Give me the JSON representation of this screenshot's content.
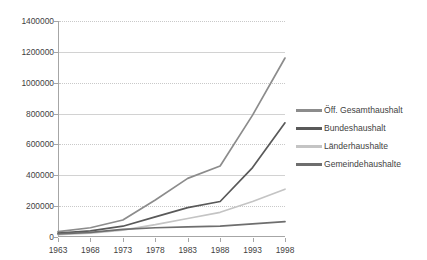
{
  "chart_data": {
    "type": "line",
    "title": "",
    "subtitle": "",
    "xlabel": "",
    "ylabel": "",
    "categories": [
      "1963",
      "1968",
      "1973",
      "1978",
      "1983",
      "1988",
      "1993",
      "1998"
    ],
    "x": [
      1963,
      1968,
      1973,
      1978,
      1983,
      1988,
      1993,
      1998
    ],
    "ylim": [
      0,
      1400000
    ],
    "xlim": [
      1963,
      1998
    ],
    "y_ticks": [
      0,
      200000,
      400000,
      600000,
      800000,
      1000000,
      1200000,
      1400000
    ],
    "y_tick_labels": [
      "0",
      "200000",
      "400000",
      "600000",
      "800000",
      "1000000",
      "1200000",
      "1400000"
    ],
    "grid": true,
    "grid_axis": "y",
    "legend_position": "right",
    "series": [
      {
        "name": "Öff. Gesamthaushalt",
        "color": "#8c8c8c",
        "values": [
          35000,
          60000,
          110000,
          240000,
          380000,
          460000,
          790000,
          1160000
        ]
      },
      {
        "name": "Bundeshaushalt",
        "color": "#595959",
        "values": [
          25000,
          40000,
          70000,
          130000,
          190000,
          230000,
          450000,
          740000
        ]
      },
      {
        "name": "Länderhaushalte",
        "color": "#c4c4c4",
        "values": [
          15000,
          25000,
          45000,
          80000,
          120000,
          160000,
          230000,
          310000
        ]
      },
      {
        "name": "Gemeindehaushalte",
        "color": "#6e6e6e",
        "values": [
          20000,
          30000,
          50000,
          60000,
          65000,
          70000,
          85000,
          100000
        ]
      }
    ]
  },
  "legend": {
    "items": [
      {
        "label": "Öff. Gesamthaushalt",
        "swatch": "legend-line-swatch"
      },
      {
        "label": "Bundeshaushalt",
        "swatch": "legend-line-swatch"
      },
      {
        "label": "Länderhaushalte",
        "swatch": "legend-line-swatch"
      },
      {
        "label": "Gemeindehaushalte",
        "swatch": "legend-line-swatch"
      }
    ]
  },
  "colors": {
    "background": "#ffffff",
    "axis": "#a6a6a6",
    "gridline": "#d2d2d2",
    "text": "#3f3f3f"
  }
}
